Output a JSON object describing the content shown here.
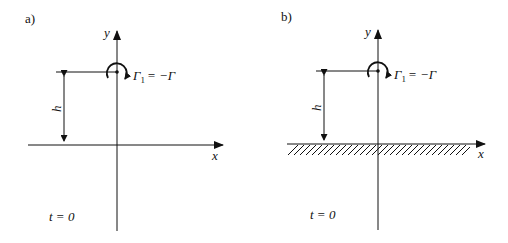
{
  "panels": [
    {
      "id": "a",
      "label": "a)",
      "y_axis_label": "y",
      "x_axis_label": "x",
      "height_label": "h",
      "vortex_label": "Γ",
      "vortex_subscript": "1",
      "vortex_value": "= −Γ",
      "time_label": "t = 0",
      "wall": false
    },
    {
      "id": "b",
      "label": "b)",
      "y_axis_label": "y",
      "x_axis_label": "x",
      "height_label": "h",
      "vortex_label": "Γ",
      "vortex_subscript": "1",
      "vortex_value": "= −Γ",
      "time_label": "t = 0",
      "wall": true
    }
  ]
}
